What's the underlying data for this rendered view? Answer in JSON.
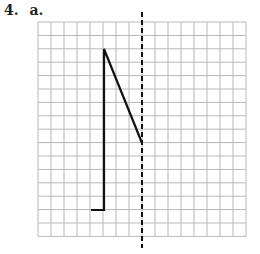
{
  "problem": {
    "number": "4.",
    "part": "a."
  },
  "grid": {
    "left": 38,
    "top": 22,
    "cols": 16,
    "rows": 16,
    "cell_w": 13,
    "cell_h": 13.4,
    "line_color": "#b8b8b8"
  },
  "mirror_line": {
    "x": 142,
    "y1": 12,
    "y2": 248,
    "style": "dashed",
    "color": "#111111"
  },
  "shape": {
    "color": "#111111",
    "points": [
      [
        91,
        210
      ],
      [
        104,
        210
      ],
      [
        104,
        49
      ],
      [
        142,
        143
      ]
    ]
  }
}
